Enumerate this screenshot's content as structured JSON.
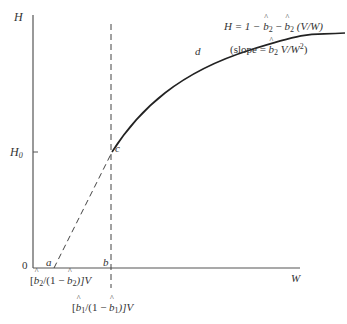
{
  "diagram": {
    "axes": {
      "y_label": "H",
      "x_label": "W",
      "origin_label": "0",
      "y_tick_label": "H",
      "y_tick_subscript": "0"
    },
    "points": {
      "a": "a",
      "b": "b",
      "c": "c",
      "d": "d"
    },
    "equation": {
      "lhs": "H = 1 − ",
      "b_hat": "b",
      "sub2": "2",
      "mid": " − ",
      "tail": " (V/W)"
    },
    "slope": {
      "open": "(slope = ",
      "b_hat": "b",
      "sub2": "2",
      "tail": " V/W",
      "sup": "2",
      "close": ")"
    },
    "x_marker_a": {
      "open": "[",
      "b_hat": "b",
      "sub": "2",
      "mid": "/(1 − ",
      "b_hat2": "b",
      "sub2": "2",
      "close": ")]V"
    },
    "x_marker_b": {
      "open": "[",
      "b_hat": "b",
      "sub": "1",
      "mid": "/(1 − ",
      "b_hat2": "b",
      "sub2": "1",
      "close": ")]V"
    },
    "colors": {
      "line": "#333333",
      "axis": "#555555"
    }
  }
}
